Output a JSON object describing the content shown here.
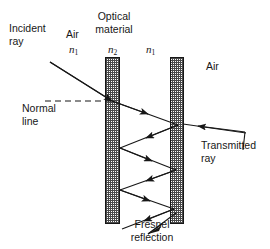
{
  "figure": {
    "background_color": "#ffffff",
    "ink_color": "#171717",
    "hatch_color": "#3a3a3a"
  },
  "labels": {
    "incident_ray": "Incident\nray",
    "air_left": "Air",
    "n1_left": "n",
    "n1_left_sub": "1",
    "optical_material": "Optical\nmaterial",
    "n2": "n",
    "n2_sub": "2",
    "n1_right": "n",
    "n1_right_sub": "1",
    "air_right": "Air",
    "normal_line": "Normal\nline",
    "transmitted_ray": "Transmitted\nray",
    "fresnel_reflection": "Fresnel\nreflection"
  },
  "geometry": {
    "slab_left": {
      "x": 105,
      "y": 57,
      "width": 15,
      "height": 167
    },
    "slab_right": {
      "x": 170,
      "y": 57,
      "width": 14,
      "height": 167
    },
    "normal_line_y": 101,
    "normal_line_x_start": 45,
    "normal_line_x_end": 112,
    "entry_point": [
      112,
      101
    ],
    "exit_point": [
      183,
      124
    ],
    "bounce_points": [
      [
        178,
        125
      ],
      [
        120,
        148
      ],
      [
        176,
        170
      ],
      [
        120,
        190
      ],
      [
        174,
        209
      ]
    ]
  }
}
